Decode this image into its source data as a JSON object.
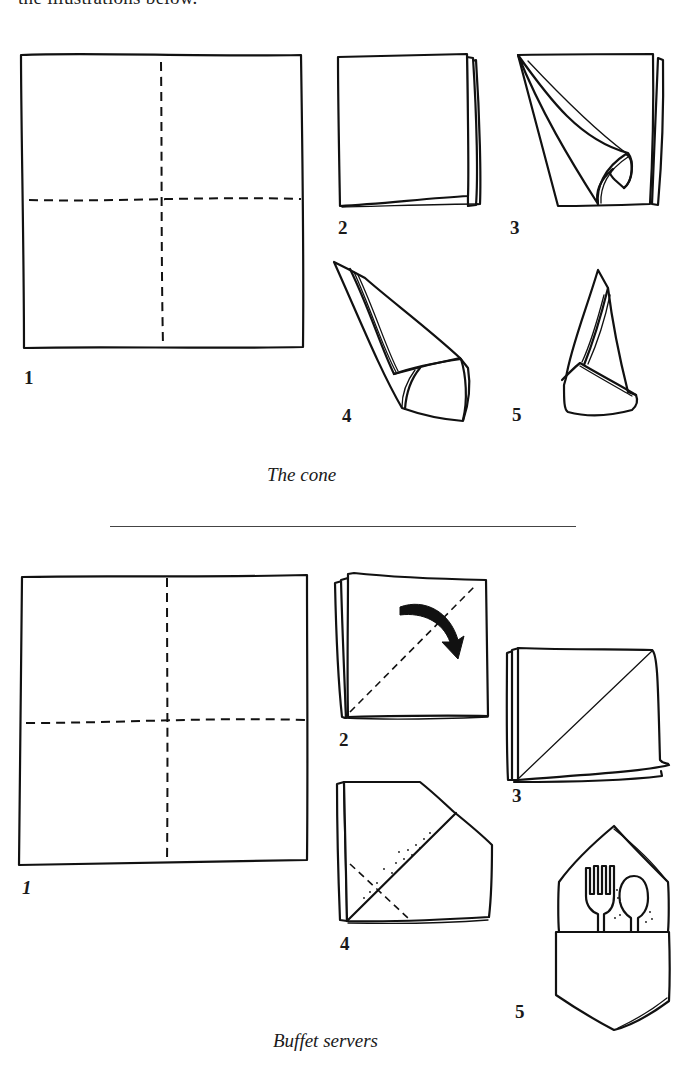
{
  "page": {
    "intro_text": "the illustrations below."
  },
  "sections": [
    {
      "id": "cone",
      "caption": "The cone",
      "steps": [
        {
          "number": "1",
          "description": "flat square napkin with dashed fold lines into quarters"
        },
        {
          "number": "2",
          "description": "napkin folded into quarters"
        },
        {
          "number": "3",
          "description": "top layer rolled into a cone"
        },
        {
          "number": "4",
          "description": "cone rotated with corner wrapped"
        },
        {
          "number": "5",
          "description": "finished standing cone"
        }
      ]
    },
    {
      "id": "buffet",
      "caption": "Buffet servers",
      "steps": [
        {
          "number": "1",
          "description": "flat square napkin with dashed fold lines into quarters"
        },
        {
          "number": "2",
          "description": "folded in quarters, fold along dashed diagonal (arrow)"
        },
        {
          "number": "3",
          "description": "folded diagonally"
        },
        {
          "number": "4",
          "description": "corners folded in with dashed fold"
        },
        {
          "number": "5",
          "description": "pocket holding fork and spoon"
        }
      ]
    }
  ],
  "icons": {
    "fold_arrow": "curved-arrow-icon",
    "fork": "fork-icon",
    "spoon": "spoon-icon"
  },
  "colors": {
    "ink": "#111111",
    "paper": "#ffffff",
    "rule": "#444444"
  }
}
